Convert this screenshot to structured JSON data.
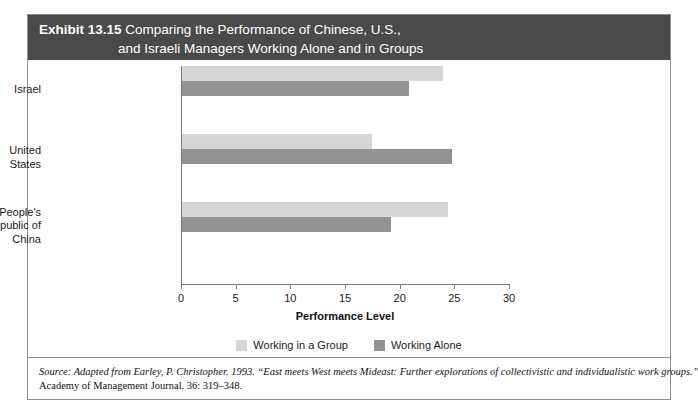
{
  "exhibit": {
    "number_label": "Exhibit 13.15",
    "title_line1": "Comparing the Performance of Chinese, U.S.,",
    "title_line2": "and Israeli Managers Working Alone and in Groups",
    "header_bg": "#4a4a4a",
    "header_text_color": "#ffffff"
  },
  "chart_data": {
    "type": "bar",
    "orientation": "horizontal",
    "title": "Comparing the Performance of Chinese, U.S., and Israeli Managers Working Alone and in Groups",
    "categories": [
      "Israel",
      "United States",
      "People's Republic of China"
    ],
    "category_lines": [
      [
        "Israel"
      ],
      [
        "United",
        "States"
      ],
      [
        "People's",
        "Republic of",
        "China"
      ]
    ],
    "series": [
      {
        "name": "Working in a Group",
        "color": "#d5d5d5",
        "values": [
          23.9,
          17.4,
          24.3
        ]
      },
      {
        "name": "Working Alone",
        "color": "#939393",
        "values": [
          20.8,
          24.7,
          19.1
        ]
      }
    ],
    "xlabel": "Performance Level",
    "ylabel": "",
    "xlim": [
      0,
      30
    ],
    "xticks": [
      0,
      5,
      10,
      15,
      20,
      25,
      30
    ],
    "xtick_labels": [
      "0",
      "5",
      "10",
      "15",
      "20",
      "25",
      "30"
    ],
    "grid": false,
    "legend_position": "bottom-center"
  },
  "legend": {
    "items": [
      {
        "label": "Working in a Group",
        "color": "#d5d5d5"
      },
      {
        "label": "Working Alone",
        "color": "#939393"
      }
    ]
  },
  "source": {
    "line1": "Source: Adapted from Earley, P. Christopher. 1993. “East meets West meets Mideast: Further explorations of collectivistic and individualistic work groups.”",
    "line2": "Academy of Management Journal. 36: 319–348."
  }
}
